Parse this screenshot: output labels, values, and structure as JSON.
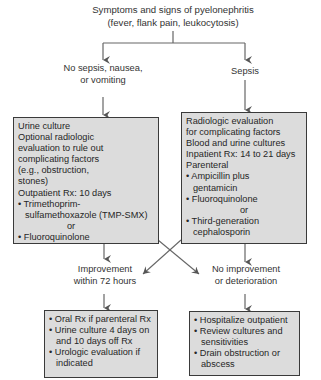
{
  "title": {
    "line1": "Symptoms and signs of pyelonephritis",
    "line2": "(fever, flank pain, leukocytosis)"
  },
  "branches": {
    "left_label": {
      "line1": "No sepsis, nausea,",
      "line2": "or vomiting"
    },
    "right_label": "Sepsis"
  },
  "left_box": {
    "lines": [
      "Urine culture",
      "Optional radiologic",
      "evaluation to rule out",
      "complicating factors",
      "(e.g., obstruction,",
      "stones)",
      "Outpatient Rx: 10 days"
    ],
    "bullet1_a": "• Trimethoprim-",
    "bullet1_b": "sulfamethoxazole (TMP-SMX)",
    "or": "or",
    "bullet2": "• Fluoroquinolone"
  },
  "right_box": {
    "lines": [
      "Radiologic evaluation",
      "for complicating factors",
      "Blood and urine cultures",
      "Inpatient Rx: 14 to 21 days",
      "Parenteral"
    ],
    "bullet1_a": "• Ampicillin plus",
    "bullet1_b": "gentamicin",
    "bullet2": "• Fluoroquinolone",
    "or": "or",
    "bullet3_a": "• Third-generation",
    "bullet3_b": "cephalosporin"
  },
  "outcomes": {
    "improvement": {
      "line1": "Improvement",
      "line2": "within 72 hours"
    },
    "no_improvement": {
      "line1": "No improvement",
      "line2": "or deterioration"
    }
  },
  "bottom_left_box": {
    "b1": "• Oral Rx if parenteral Rx",
    "b2a": "• Urine culture 4 days on",
    "b2b": "and 10 days off Rx",
    "b3a": "• Urologic evaluation if",
    "b3b": "indicated"
  },
  "bottom_right_box": {
    "b1": "• Hospitalize outpatient",
    "b2a": "• Review cultures and",
    "b2b": "sensitivities",
    "b3a": "• Drain obstruction or",
    "b3b": "abscess"
  },
  "colors": {
    "box_fill": "#dcdcdc",
    "box_border": "#3a3a3a",
    "line": "#555555"
  }
}
